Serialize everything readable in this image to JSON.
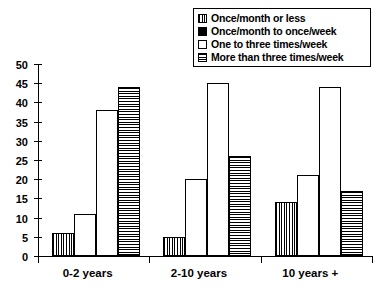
{
  "chart_data": {
    "type": "bar",
    "title": "",
    "xlabel": "",
    "ylabel": "",
    "ylim": [
      0,
      50
    ],
    "yticks": [
      0,
      5,
      10,
      15,
      20,
      25,
      30,
      35,
      40,
      45,
      50
    ],
    "grid": false,
    "legend_position": "top-right",
    "categories": [
      "0-2 years",
      "2-10 years",
      "10 years +"
    ],
    "series": [
      {
        "name": "Once/month or less",
        "pattern": "vertical-hatch",
        "values": [
          6,
          5,
          14
        ]
      },
      {
        "name": "Once/month to once/week",
        "pattern": "solid-black",
        "values": [
          11,
          20,
          21
        ]
      },
      {
        "name": "One to three times/week",
        "pattern": "white",
        "values": [
          38,
          45,
          44
        ]
      },
      {
        "name": "More than three times/week",
        "pattern": "horizontal-hatch",
        "values": [
          44,
          26,
          17
        ]
      }
    ]
  },
  "colors": {
    "ink": "#000000",
    "paper": "#ffffff"
  }
}
